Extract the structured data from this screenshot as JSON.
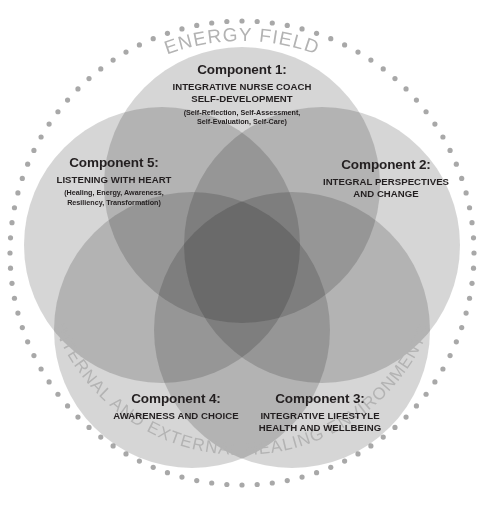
{
  "diagram": {
    "outer_ring": {
      "top_label": "ENERGY FIELD",
      "bottom_label": "INTERNAL AND EXTERNAL HEALING ENVIRONMENTS",
      "style": "dotted-circle",
      "dot_count": 96,
      "dot_color": "#a8a8a8"
    },
    "components": [
      {
        "id": "component-1",
        "title": "Component 1:",
        "subtitle_lines": [
          "INTEGRATIVE NURSE COACH",
          "SELF-DEVELOPMENT"
        ],
        "detail_lines": [
          "(Self-Reflection, Self-Assessment,",
          "Self-Evaluation, Self-Care)"
        ],
        "position": "top",
        "circle_color": "#b9b9b9"
      },
      {
        "id": "component-2",
        "title": "Component 2:",
        "subtitle_lines": [
          "INTEGRAL PERSPECTIVES",
          "AND CHANGE"
        ],
        "detail_lines": [],
        "position": "right",
        "circle_color": "#bdbdbd"
      },
      {
        "id": "component-3",
        "title": "Component 3:",
        "subtitle_lines": [
          "INTEGRATIVE LIFESTYLE",
          "HEALTH AND WELLBEING"
        ],
        "detail_lines": [],
        "position": "bottom-right",
        "circle_color": "#bdbdbd"
      },
      {
        "id": "component-4",
        "title": "Component 4:",
        "subtitle_lines": [
          "AWARENESS AND CHOICE"
        ],
        "detail_lines": [],
        "position": "bottom-left",
        "circle_color": "#bdbdbd"
      },
      {
        "id": "component-5",
        "title": "Component 5:",
        "subtitle_lines": [
          "LISTENING WITH HEART"
        ],
        "detail_lines": [
          "(Healing, Energy, Awareness,",
          "Resiliency, Transformation)"
        ],
        "position": "left",
        "circle_color": "#bdbdbd"
      }
    ],
    "colors": {
      "background": "#ffffff",
      "text": "#231f20",
      "arc_text": "#b3b3b3",
      "circle_fill": "#bdbdbd"
    }
  },
  "chart_data": {
    "type": "diagram",
    "subtype": "venn-5-circle",
    "sets": [
      {
        "name": "Component 1: Integrative Nurse Coach Self-Development",
        "cx": 242,
        "cy": 185,
        "r": 138
      },
      {
        "name": "Component 2: Integral Perspectives and Change",
        "cx": 322,
        "cy": 245,
        "r": 138
      },
      {
        "name": "Component 3: Integrative Lifestyle Health and Wellbeing",
        "cx": 292,
        "cy": 330,
        "r": 138
      },
      {
        "name": "Component 4: Awareness and Choice",
        "cx": 192,
        "cy": 330,
        "r": 138
      },
      {
        "name": "Component 5: Listening with Heart",
        "cx": 162,
        "cy": 245,
        "r": 138
      }
    ],
    "enclosing_ring": {
      "cx": 242,
      "cy": 253,
      "r": 232,
      "label_top": "ENERGY FIELD",
      "label_bottom": "INTERNAL AND EXTERNAL HEALING ENVIRONMENTS"
    }
  }
}
